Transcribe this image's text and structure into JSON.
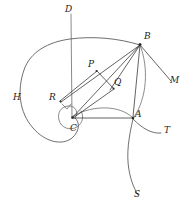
{
  "figure": {
    "width": 185,
    "height": 207,
    "background_color": "#ffffff",
    "stroke_color": "#4a4a4a",
    "label_color": "#1d1d1d"
  },
  "labels": {
    "D": "D",
    "B": "B",
    "M": "M",
    "P": "P",
    "Q": "Q",
    "H": "H",
    "R": "R",
    "A": "A",
    "C": "C",
    "T": "T",
    "S": "S"
  },
  "points": {
    "D": {
      "x": 71,
      "y": 13,
      "label_x": 65,
      "label_y": 6
    },
    "B": {
      "x": 140,
      "y": 44,
      "label_x": 144,
      "label_y": 33
    },
    "M": {
      "x": 172,
      "y": 82,
      "label_x": 172,
      "label_y": 78
    },
    "P": {
      "x": 95,
      "y": 70,
      "label_x": 89,
      "label_y": 63
    },
    "Q": {
      "x": 113,
      "y": 87,
      "label_x": 113,
      "label_y": 83
    },
    "H": {
      "x": 23,
      "y": 100,
      "label_x": 15,
      "label_y": 94
    },
    "R": {
      "x": 60,
      "y": 101,
      "label_x": 51,
      "label_y": 95
    },
    "A": {
      "x": 133,
      "y": 118,
      "label_x": 135,
      "label_y": 112
    },
    "C": {
      "x": 72,
      "y": 118,
      "label_x": 71,
      "label_y": 122
    },
    "T": {
      "x": 164,
      "y": 134,
      "label_x": 164,
      "label_y": 128
    },
    "S": {
      "x": 137,
      "y": 196,
      "label_x": 136,
      "label_y": 192
    }
  },
  "elements": {
    "spiral_outer_name": "logarithmic-spiral-H",
    "spiral_inner_name": "logarithmic-spiral-S",
    "axis_name": "vertical-axis-D",
    "ray_ba_name": "segment-B-A",
    "ray_bc_name": "segment-B-C",
    "ray_br_name": "segment-B-R",
    "ray_bq_name": "segment-B-Q",
    "ray_bm_name": "segment-B-M",
    "ray_ca_name": "segment-C-A",
    "ray_rp_name": "segment-R-P",
    "ray_pq_name": "segment-P-Q",
    "arc_ba_name": "arc-B-A",
    "arc_ca_name": "arc-C-A",
    "tangent_t_name": "tangent-curve-T",
    "right_angle_r_name": "right-angle-marker-R"
  }
}
